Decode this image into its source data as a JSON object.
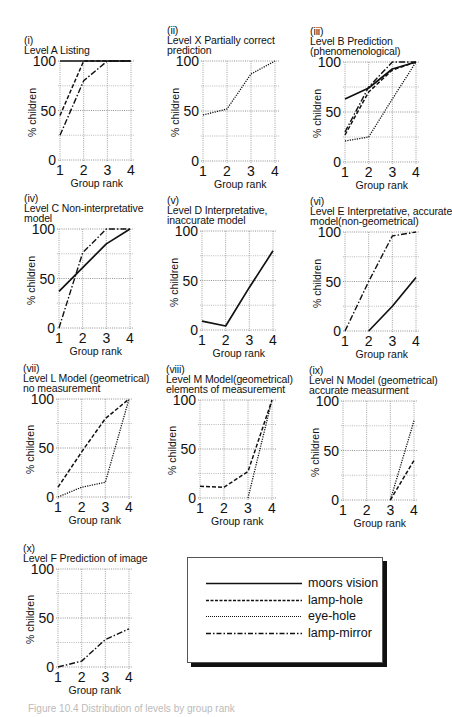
{
  "figure": {
    "caption": "Figure 10.4  Distribution of levels by group rank",
    "legend": {
      "items": [
        {
          "key": "moors",
          "label": "moors vision",
          "dash": ""
        },
        {
          "key": "lamp_hole",
          "label": "lamp-hole",
          "dash": "4,2"
        },
        {
          "key": "eye_hole",
          "label": "eye-hole",
          "dash": "1.2,1.2"
        },
        {
          "key": "lamp_mirror",
          "label": "lamp-mirror",
          "dash": "6,2,1.5,2"
        }
      ]
    },
    "axis_common": {
      "ylabel": "% children",
      "xlabel": "Group rank",
      "yticks": [
        "100",
        "50",
        "0"
      ],
      "xticks": [
        "1",
        "2",
        "3",
        "4"
      ]
    }
  },
  "chart_data": [
    {
      "type": "line",
      "id": "i",
      "title": "(i)\nLevel A Listing",
      "xlabel": "Group rank",
      "ylabel": "% children",
      "x": [
        1,
        2,
        3,
        4
      ],
      "ylim": [
        0,
        100
      ],
      "grid": true,
      "series": [
        {
          "name": "moors vision",
          "values": [
            100,
            100,
            100,
            100
          ]
        },
        {
          "name": "lamp-hole",
          "values": [
            45,
            100,
            100,
            100
          ]
        },
        {
          "name": "lamp-mirror",
          "values": [
            25,
            80,
            100,
            100
          ]
        }
      ]
    },
    {
      "type": "line",
      "id": "ii",
      "title": "(ii)\nLevel X Partially correct\nprediction",
      "xlabel": "Group rank",
      "ylabel": "% children",
      "x": [
        1,
        2,
        3,
        4
      ],
      "ylim": [
        0,
        100
      ],
      "grid": true,
      "series": [
        {
          "name": "eye-hole",
          "values": [
            46,
            52,
            87,
            100
          ]
        }
      ]
    },
    {
      "type": "line",
      "id": "iii",
      "title": "(iii)\nLevel B Prediction\n(phenomenological)",
      "xlabel": "Group rank",
      "ylabel": "% children",
      "x": [
        1,
        2,
        3,
        4
      ],
      "ylim": [
        0,
        100
      ],
      "grid": true,
      "series": [
        {
          "name": "moors vision",
          "values": [
            63,
            74,
            93,
            100
          ]
        },
        {
          "name": "lamp-hole",
          "values": [
            27,
            70,
            92,
            100
          ]
        },
        {
          "name": "eye-hole",
          "values": [
            21,
            25,
            63,
            100
          ]
        },
        {
          "name": "lamp-mirror",
          "values": [
            30,
            75,
            100,
            100
          ]
        }
      ]
    },
    {
      "type": "line",
      "id": "iv",
      "title": "(iv)\nLevel C Non-interpretative\nmodel",
      "xlabel": "Group rank",
      "ylabel": "% children",
      "x": [
        1,
        2,
        3,
        4
      ],
      "ylim": [
        0,
        100
      ],
      "grid": true,
      "series": [
        {
          "name": "moors vision",
          "values": [
            37,
            61,
            85,
            100
          ]
        },
        {
          "name": "lamp-mirror",
          "values": [
            0,
            76,
            100,
            100
          ]
        }
      ]
    },
    {
      "type": "line",
      "id": "v",
      "title": "(v)\nLevel D Interpretative,\ninaccurate model",
      "xlabel": "Group rank",
      "ylabel": "% children",
      "x": [
        1,
        2,
        3,
        4
      ],
      "ylim": [
        0,
        100
      ],
      "grid": true,
      "series": [
        {
          "name": "moors vision",
          "values": [
            9,
            4,
            43,
            80
          ]
        }
      ]
    },
    {
      "type": "line",
      "id": "vi",
      "title": "(vi)\nLevel E Interpretative, accurate\nmodel(non-geometrical)",
      "xlabel": "Group rank",
      "ylabel": "% children",
      "x": [
        1,
        2,
        3,
        4
      ],
      "ylim": [
        0,
        100
      ],
      "grid": true,
      "series": [
        {
          "name": "moors vision",
          "values": [
            null,
            0,
            25,
            54
          ]
        },
        {
          "name": "lamp-mirror",
          "values": [
            0,
            50,
            96,
            100
          ]
        }
      ]
    },
    {
      "type": "line",
      "id": "vii",
      "title": "(vii)\nLevel L Model (geometrical)\nno measurement",
      "xlabel": "Group rank",
      "ylabel": "% children",
      "x": [
        1,
        2,
        3,
        4
      ],
      "ylim": [
        0,
        100
      ],
      "grid": true,
      "series": [
        {
          "name": "lamp-hole",
          "values": [
            10,
            46,
            80,
            100
          ]
        },
        {
          "name": "eye-hole",
          "values": [
            0,
            10,
            15,
            100
          ]
        }
      ]
    },
    {
      "type": "line",
      "id": "viii",
      "title": "(viii)\nLevel M Model(geometrical)\nelements of measurement",
      "xlabel": "Group rank",
      "ylabel": "% children",
      "x": [
        1,
        2,
        3,
        4
      ],
      "ylim": [
        0,
        100
      ],
      "grid": true,
      "series": [
        {
          "name": "lamp-hole",
          "values": [
            12,
            11,
            27,
            100
          ]
        },
        {
          "name": "eye-hole",
          "values": [
            null,
            null,
            0,
            100
          ]
        }
      ]
    },
    {
      "type": "line",
      "id": "ix",
      "title": "(ix)\nLevel N Model (geometrical)\naccurate measurment",
      "xlabel": "Group rank",
      "ylabel": "% children",
      "x": [
        1,
        2,
        3,
        4
      ],
      "ylim": [
        0,
        100
      ],
      "grid": true,
      "series": [
        {
          "name": "eye-hole",
          "values": [
            null,
            null,
            0,
            80
          ]
        },
        {
          "name": "lamp-hole",
          "values": [
            null,
            null,
            0,
            40
          ]
        }
      ]
    },
    {
      "type": "line",
      "id": "x",
      "title": "(x)\nLevel F Prediction of image",
      "xlabel": "Group rank",
      "ylabel": "% children",
      "x": [
        1,
        2,
        3,
        4
      ],
      "ylim": [
        0,
        100
      ],
      "grid": true,
      "series": [
        {
          "name": "lamp-mirror",
          "values": [
            0,
            6,
            28,
            39
          ]
        }
      ]
    }
  ],
  "layout": {
    "panels": [
      {
        "title_x": 24,
        "title_y": 6,
        "px": 60,
        "py": 61,
        "pw": 71,
        "ph": 99
      },
      {
        "title_x": 167,
        "title_y": 6,
        "px": 203,
        "py": 61,
        "pw": 72,
        "ph": 100
      },
      {
        "title_x": 310,
        "title_y": 6,
        "px": 345,
        "py": 62,
        "pw": 71,
        "ph": 100
      },
      {
        "title_x": 24,
        "title_y": 183,
        "px": 59,
        "py": 229,
        "pw": 71,
        "ph": 99
      },
      {
        "title_x": 167,
        "title_y": 183,
        "px": 202,
        "py": 231,
        "pw": 71,
        "ph": 99
      },
      {
        "title_x": 310,
        "title_y": 183,
        "px": 345,
        "py": 232,
        "pw": 71,
        "ph": 99
      },
      {
        "title_x": 23,
        "title_y": 352,
        "px": 58,
        "py": 399,
        "pw": 71,
        "ph": 98
      },
      {
        "title_x": 166,
        "title_y": 352,
        "px": 200,
        "py": 400,
        "pw": 72,
        "ph": 98
      },
      {
        "title_x": 309,
        "title_y": 353,
        "px": 343,
        "py": 401,
        "pw": 71,
        "ph": 99
      },
      {
        "title_x": 23,
        "title_y": 544,
        "px": 58,
        "py": 569,
        "pw": 71,
        "ph": 98
      }
    ]
  }
}
